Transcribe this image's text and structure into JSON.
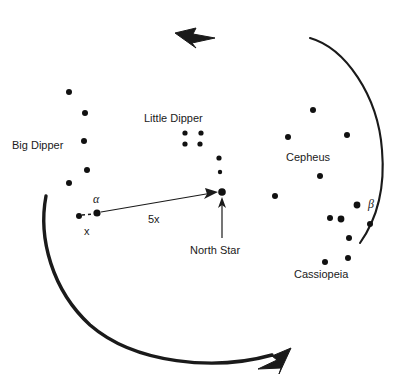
{
  "chart_data": {
    "type": "scatter",
    "title": "",
    "xlabel": "",
    "ylabel": "",
    "xlim": [
      0,
      413
    ],
    "ylim": [
      385,
      0
    ],
    "grid": false,
    "legend": "none",
    "annotations": [
      {
        "name": "rotation-direction",
        "value": "counterclockwise"
      },
      {
        "name": "pointer-gap",
        "value": "x"
      },
      {
        "name": "pointer-to-polaris",
        "value": "5x"
      }
    ],
    "constellations": [
      {
        "name": "Big Dipper",
        "label": "Big Dipper",
        "label_x": 12,
        "label_y": 140,
        "stars": [
          {
            "x": 69,
            "y": 92,
            "r": 3.0
          },
          {
            "x": 85,
            "y": 113,
            "r": 3.0
          },
          {
            "x": 84,
            "y": 141,
            "r": 3.0
          },
          {
            "x": 87,
            "y": 170,
            "r": 3.0
          },
          {
            "x": 69,
            "y": 183,
            "r": 3.0
          },
          {
            "x": 79,
            "y": 216,
            "r": 3.0,
            "note": "pointer-star-outer"
          },
          {
            "x": 97,
            "y": 213,
            "r": 3.6,
            "note": "pointer-star-alpha"
          }
        ]
      },
      {
        "name": "Little Dipper",
        "label": "Little Dipper",
        "label_x": 144,
        "label_y": 113,
        "stars": [
          {
            "x": 185,
            "y": 133,
            "r": 2.6
          },
          {
            "x": 201,
            "y": 133,
            "r": 2.6
          },
          {
            "x": 185,
            "y": 144,
            "r": 2.6
          },
          {
            "x": 200,
            "y": 144,
            "r": 2.6
          },
          {
            "x": 219,
            "y": 158,
            "r": 2.6
          },
          {
            "x": 220,
            "y": 172,
            "r": 2.2
          },
          {
            "x": 222,
            "y": 192,
            "r": 3.8,
            "note": "north-star"
          }
        ]
      },
      {
        "name": "Cepheus",
        "label": "Cepheus",
        "label_x": 286,
        "label_y": 152,
        "stars": [
          {
            "x": 313,
            "y": 110,
            "r": 3.0
          },
          {
            "x": 288,
            "y": 137,
            "r": 3.0
          },
          {
            "x": 347,
            "y": 135,
            "r": 3.0
          },
          {
            "x": 320,
            "y": 176,
            "r": 3.0
          },
          {
            "x": 275,
            "y": 196,
            "r": 3.0
          }
        ]
      },
      {
        "name": "Cassiopeia",
        "label": "Cassiopeia",
        "label_x": 294,
        "label_y": 269,
        "stars": [
          {
            "x": 357,
            "y": 205,
            "r": 3.4,
            "note": "beta-star"
          },
          {
            "x": 330,
            "y": 218,
            "r": 3.0
          },
          {
            "x": 341,
            "y": 219,
            "r": 3.4
          },
          {
            "x": 370,
            "y": 224,
            "r": 3.0
          },
          {
            "x": 349,
            "y": 238,
            "r": 3.0
          },
          {
            "x": 348,
            "y": 258,
            "r": 3.0
          },
          {
            "x": 325,
            "y": 262,
            "r": 3.0
          }
        ]
      }
    ],
    "star_labels": [
      {
        "name": "alpha",
        "text": "α",
        "x": 93,
        "y": 193
      },
      {
        "name": "beta",
        "text": "β",
        "x": 368,
        "y": 198
      },
      {
        "name": "x-distance",
        "text": "x",
        "x": 84,
        "y": 226
      },
      {
        "name": "five-x-distance",
        "text": "5x",
        "x": 148,
        "y": 214
      }
    ],
    "callouts": [
      {
        "name": "north-star",
        "text": "North Star",
        "x": 190,
        "y": 245
      }
    ]
  },
  "style": {
    "star_color": "#111111",
    "line_color": "#1a1a1a",
    "arc_color": "#1a1a1a",
    "text_color": "#1a1a1a",
    "background": "#ffffff"
  }
}
